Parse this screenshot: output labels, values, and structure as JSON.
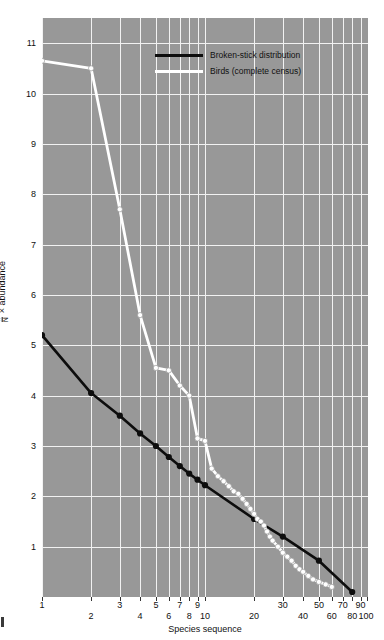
{
  "chart_data": {
    "type": "line",
    "title": "",
    "xlabel": "Species sequence",
    "ylabel": "n/N × abundance",
    "ylabel_fraction": {
      "numerator": "n",
      "denominator": "N",
      "suffix": "× abundance"
    },
    "xscale": "log",
    "yscale": "linear",
    "xlim": [
      1,
      100
    ],
    "ylim": [
      0,
      11.5
    ],
    "grid": true,
    "legend_position": "top-center",
    "background_color": "#989898",
    "grid_color": "#f2f2f2",
    "yticks": [
      1,
      2,
      3,
      4,
      5,
      6,
      7,
      8,
      9,
      10,
      11
    ],
    "xticks": [
      1,
      2,
      3,
      4,
      5,
      6,
      7,
      8,
      9,
      10,
      20,
      30,
      40,
      50,
      60,
      70,
      80,
      90,
      100
    ],
    "xticks_upper_row": [
      1,
      3,
      5,
      7,
      9,
      30,
      50,
      70,
      90
    ],
    "xticks_lower_row": [
      2,
      4,
      6,
      8,
      10,
      20,
      40,
      60,
      80,
      100
    ],
    "series": [
      {
        "name": "Broken-stick distribution",
        "color": "#0d0d0d",
        "marker": "filled-circle",
        "x": [
          1,
          2,
          3,
          4,
          5,
          6,
          7,
          8,
          9,
          10,
          20,
          30,
          50,
          80
        ],
        "y": [
          5.2,
          4.05,
          3.6,
          3.25,
          3.0,
          2.78,
          2.6,
          2.45,
          2.33,
          2.22,
          1.55,
          1.2,
          0.72,
          0.1
        ]
      },
      {
        "name": "Birds (complete census)",
        "color": "#ffffff",
        "marker": "open-circle",
        "x": [
          1,
          2,
          3,
          4,
          5,
          6,
          7,
          8,
          9,
          10,
          11,
          12,
          13,
          14,
          15,
          16,
          17,
          18,
          19,
          20,
          21,
          22,
          23,
          24,
          25,
          26,
          28,
          30,
          32,
          34,
          36,
          38,
          40,
          43,
          46,
          50,
          55,
          60
        ],
        "y": [
          10.65,
          10.5,
          7.7,
          5.6,
          4.55,
          4.5,
          4.2,
          4.0,
          3.15,
          3.1,
          2.55,
          2.4,
          2.3,
          2.2,
          2.1,
          2.05,
          1.95,
          1.85,
          1.75,
          1.65,
          1.55,
          1.5,
          1.42,
          1.3,
          1.2,
          1.12,
          1.0,
          0.88,
          0.8,
          0.72,
          0.62,
          0.55,
          0.5,
          0.42,
          0.35,
          0.3,
          0.25,
          0.2
        ]
      }
    ]
  },
  "legend": {
    "items": [
      {
        "label": "Broken-stick distribution",
        "color": "#0d0d0d"
      },
      {
        "label": "Birds (complete census)",
        "color": "#ffffff"
      }
    ]
  }
}
